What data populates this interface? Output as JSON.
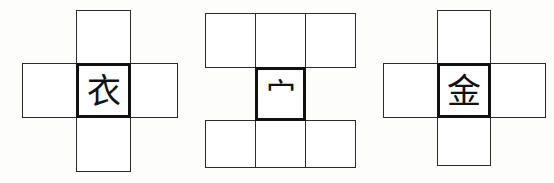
{
  "page": {
    "background_color": "#fdfdfc",
    "line_color": "#2b2b2b",
    "bold_line_color": "#111111",
    "glyph_color": "#111111"
  },
  "figures": [
    {
      "id": "figure-1",
      "shape": "plus",
      "center_character": "衣",
      "center_meaning": "clothing radical",
      "cells": [
        {
          "position": "top",
          "character": ""
        },
        {
          "position": "left",
          "character": ""
        },
        {
          "position": "center",
          "character": "衣"
        },
        {
          "position": "right",
          "character": ""
        },
        {
          "position": "bottom",
          "character": ""
        }
      ]
    },
    {
      "id": "figure-2",
      "shape": "i-beam",
      "center_character": "宀",
      "center_meaning": "roof radical",
      "cells": [
        {
          "position": "top-left",
          "character": ""
        },
        {
          "position": "top-middle",
          "character": ""
        },
        {
          "position": "top-right",
          "character": ""
        },
        {
          "position": "center",
          "character": "宀"
        },
        {
          "position": "bottom-left",
          "character": ""
        },
        {
          "position": "bottom-middle",
          "character": ""
        },
        {
          "position": "bottom-right",
          "character": ""
        }
      ]
    },
    {
      "id": "figure-3",
      "shape": "plus",
      "center_character": "金",
      "center_meaning": "gold / metal radical",
      "cells": [
        {
          "position": "top",
          "character": ""
        },
        {
          "position": "left",
          "character": ""
        },
        {
          "position": "center",
          "character": "金"
        },
        {
          "position": "right",
          "character": ""
        },
        {
          "position": "bottom",
          "character": ""
        }
      ]
    }
  ]
}
